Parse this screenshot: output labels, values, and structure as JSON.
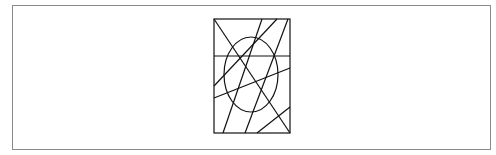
{
  "figure": {
    "stroke_color": "#111111",
    "frame_color": "#8a8a8a",
    "rectangle": {
      "x": 214,
      "y": 19,
      "width": 76,
      "height": 114
    },
    "horizontal_line": {
      "x1": 214,
      "y1": 56,
      "x2": 290,
      "y2": 56
    },
    "ellipse": {
      "cx": 251,
      "cy": 74.5,
      "rx": 27,
      "ry": 37.5
    },
    "lines": [
      {
        "x1": 214,
        "y1": 19,
        "x2": 290,
        "y2": 133
      },
      {
        "x1": 262,
        "y1": 19,
        "x2": 223,
        "y2": 133
      },
      {
        "x1": 277,
        "y1": 19,
        "x2": 214,
        "y2": 86
      },
      {
        "x1": 288,
        "y1": 19,
        "x2": 245,
        "y2": 133
      },
      {
        "x1": 214,
        "y1": 98,
        "x2": 290,
        "y2": 68
      },
      {
        "x1": 290,
        "y1": 107,
        "x2": 257,
        "y2": 133
      }
    ]
  }
}
